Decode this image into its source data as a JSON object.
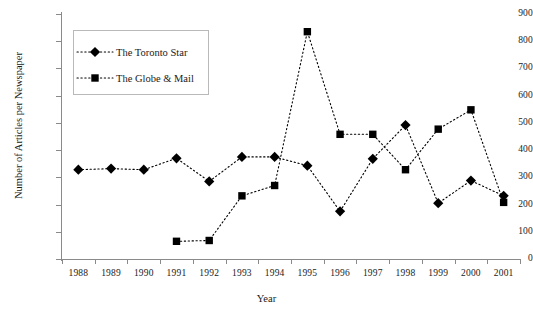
{
  "chart_data": {
    "type": "line",
    "title": "",
    "xlabel": "Year",
    "ylabel": "Number of Articles per Newspaper",
    "categories": [
      "1988",
      "1989",
      "1990",
      "1991",
      "1992",
      "1993",
      "1994",
      "1995",
      "1996",
      "1997",
      "1998",
      "1999",
      "2000",
      "2001"
    ],
    "ylim": [
      0,
      900
    ],
    "yticks": [
      0,
      100,
      200,
      300,
      400,
      500,
      600,
      700,
      800,
      900
    ],
    "grid": false,
    "legend_position": "upper-left-inside",
    "series": [
      {
        "name": "The Toronto Star",
        "marker": "diamond",
        "linestyle": "dotted",
        "color": "#000000",
        "values": [
          328,
          332,
          328,
          370,
          285,
          375,
          375,
          343,
          175,
          368,
          492,
          205,
          288,
          232
        ]
      },
      {
        "name": "The Globe & Mail",
        "marker": "square",
        "linestyle": "dotted",
        "color": "#000000",
        "values": [
          null,
          null,
          null,
          65,
          68,
          232,
          270,
          835,
          458,
          458,
          328,
          477,
          548,
          208
        ]
      }
    ]
  },
  "axis": {
    "y_title": "Number of Articles per Newspaper",
    "x_title": "Year",
    "y_labels": [
      "900",
      "800",
      "700",
      "600",
      "500",
      "400",
      "300",
      "200",
      "100",
      "0"
    ],
    "x_labels": [
      "1988",
      "1989",
      "1990",
      "1991",
      "1992",
      "1993",
      "1994",
      "1995",
      "1996",
      "1997",
      "1998",
      "1999",
      "2000",
      "2001"
    ]
  },
  "legend": {
    "entries": [
      {
        "label": "The Toronto Star",
        "marker": "diamond-marker"
      },
      {
        "label": "The Globe & Mail",
        "marker": "square-marker"
      }
    ]
  }
}
